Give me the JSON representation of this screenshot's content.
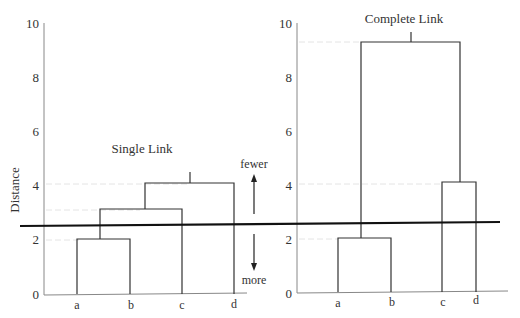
{
  "figure": {
    "y_axis_label": "Distance",
    "y_ticks": [
      "0",
      "2",
      "4",
      "6",
      "8",
      "10"
    ],
    "cut_line_value": 2.6,
    "arrow_labels": {
      "up": "fewer",
      "down": "more"
    },
    "colors": {
      "line": "#333333",
      "cut_line": "#111111",
      "gridline": "#e4e4e4",
      "axis": "#888888"
    }
  },
  "panels": [
    {
      "title": "Single Link",
      "leaves": [
        "a",
        "b",
        "c",
        "d"
      ],
      "merges": [
        {
          "left": "a",
          "right": "b",
          "height": 2.0
        },
        {
          "left": "ab",
          "right": "c",
          "height": 3.1
        },
        {
          "left": "abc",
          "right": "d",
          "height": 4.1
        }
      ]
    },
    {
      "title": "Complete Link",
      "leaves": [
        "a",
        "b",
        "c",
        "d"
      ],
      "merges": [
        {
          "left": "a",
          "right": "b",
          "height": 2.0
        },
        {
          "left": "c",
          "right": "d",
          "height": 4.1
        },
        {
          "left": "ab",
          "right": "cd",
          "height": 9.3
        }
      ]
    }
  ]
}
